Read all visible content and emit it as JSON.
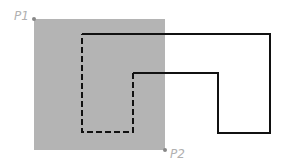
{
  "diagram": {
    "rect": {
      "x1": 34,
      "y1": 19,
      "x2": 165,
      "y2": 150,
      "fill": "#b4b4b4"
    },
    "points": [
      {
        "label": "P1",
        "x": 34,
        "y": 19
      },
      {
        "label": "P2",
        "x": 165,
        "y": 150
      }
    ],
    "shape": {
      "stroke": "#111111",
      "outline": [
        [
          82,
          34
        ],
        [
          270,
          34
        ],
        [
          270,
          133
        ],
        [
          218,
          133
        ],
        [
          218,
          73
        ],
        [
          133,
          73
        ],
        [
          133,
          132
        ],
        [
          82,
          132
        ]
      ]
    }
  }
}
